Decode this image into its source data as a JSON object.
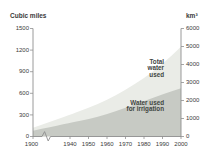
{
  "title": "WATER DEMAND IN THE 20TH CENTURY",
  "chart_data": {
    "type": "area",
    "title": "WATER DEMAND IN THE 20TH CENTURY",
    "x": [
      1900,
      1940,
      1950,
      1960,
      1970,
      1980,
      1990,
      2000
    ],
    "x_tick_labels": [
      "1900",
      "1940",
      "1950",
      "1960",
      "1970",
      "1980",
      "1990",
      "2000"
    ],
    "x_axis_break_between": [
      1900,
      1940
    ],
    "series": [
      {
        "name": "Total water used",
        "label_lines": [
          "Total",
          "water",
          "used"
        ],
        "values": [
          120,
          300,
          400,
          505,
          645,
          810,
          1005,
          1245
        ],
        "color": "#eaece7"
      },
      {
        "name": "Water used for irrigation",
        "label_lines": [
          "Water used",
          "for irrigation"
        ],
        "values": [
          80,
          190,
          240,
          310,
          400,
          490,
          585,
          670
        ],
        "color": "#c7cac4"
      }
    ],
    "left_axis": {
      "label": "Cubic miles",
      "ticks": [
        0,
        300,
        600,
        900,
        1200,
        1500
      ],
      "max": 1500
    },
    "right_axis": {
      "label": "km³",
      "ticks": [
        0,
        1000,
        2000,
        3000,
        4000,
        5000,
        6000
      ],
      "max": 6000
    },
    "value_units": "cubic miles (left axis), km³ (right axis)",
    "legend_position": "labels inside plot, right-aligned",
    "grid": "off",
    "axis_color": "#8f8f8f",
    "text_color": "#3a3a3a"
  }
}
